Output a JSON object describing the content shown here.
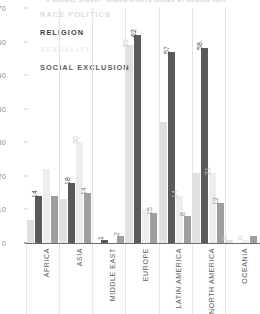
{
  "title": "A GLOBAL SURVEY: HUMAN RIGHTS ISSUES BY REGION 2014",
  "legend": {
    "position": "top-left",
    "items": [
      {
        "label": "RACE POLITICS",
        "color": "#e0e0e0"
      },
      {
        "label": "RELIGION",
        "color": "#5a5a5a"
      },
      {
        "label": "SEXUALITY",
        "color": "#ededed"
      },
      {
        "label": "SOCIAL EXCLUSION",
        "color": "#9f9f9f"
      }
    ]
  },
  "chart_data": {
    "type": "bar",
    "title": "A GLOBAL SURVEY: HUMAN RIGHTS ISSUES BY REGION 2014",
    "xlabel": "",
    "ylabel": "",
    "ylim": [
      0,
      70
    ],
    "yticks": [
      0,
      10,
      20,
      30,
      40,
      50,
      60,
      70
    ],
    "grid": false,
    "legend_position": "top-left",
    "categories": [
      "AFRICA",
      "ASIA",
      "MIDDLE EAST",
      "EUROPE",
      "LATIN AMERICA",
      "NORTH AMERICA",
      "OCEANIA"
    ],
    "series": [
      {
        "name": "RACE POLITICS",
        "color": "#e0e0e0",
        "values": [
          7,
          13,
          0,
          59,
          36,
          21,
          1
        ]
      },
      {
        "name": "RELIGION",
        "color": "#5a5a5a",
        "values": [
          14,
          18,
          1,
          62,
          57,
          58,
          0
        ]
      },
      {
        "name": "SEXUALITY",
        "color": "#ededed",
        "values": [
          22,
          30,
          0,
          10,
          14,
          21,
          1
        ]
      },
      {
        "name": "SOCIAL EXCLUSION",
        "color": "#9f9f9f",
        "values": [
          14,
          15,
          2,
          9,
          8,
          12,
          2
        ]
      }
    ],
    "point_labels": [
      {
        "category": "AFRICA",
        "series": "RELIGION",
        "value": 14
      },
      {
        "category": "ASIA",
        "series": "RELIGION",
        "value": 18
      },
      {
        "category": "ASIA",
        "series": "SOCIAL EXCLUSION",
        "value": 14
      },
      {
        "category": "ASIA",
        "series": "SEXUALITY",
        "value": 30
      },
      {
        "category": "MIDDLE EAST",
        "series": "RELIGION",
        "value": 1
      },
      {
        "category": "MIDDLE EAST",
        "series": "SOCIAL EXCLUSION",
        "value": 2
      },
      {
        "category": "EUROPE",
        "series": "RELIGION",
        "value": 62
      },
      {
        "category": "EUROPE",
        "series": "RACE POLITICS",
        "value": 59
      },
      {
        "category": "EUROPE",
        "series": "SOCIAL EXCLUSION",
        "value": 15
      },
      {
        "category": "LATIN AMERICA",
        "series": "RELIGION",
        "value": 57
      },
      {
        "category": "LATIN AMERICA",
        "series": "SEXUALITY",
        "value": 14
      },
      {
        "category": "LATIN AMERICA",
        "series": "SOCIAL EXCLUSION",
        "value": 8
      },
      {
        "category": "NORTH AMERICA",
        "series": "RELIGION",
        "value": 58
      },
      {
        "category": "NORTH AMERICA",
        "series": "SEXUALITY",
        "value": 21
      },
      {
        "category": "NORTH AMERICA",
        "series": "SOCIAL EXCLUSION",
        "value": 12
      },
      {
        "category": "OCEANIA",
        "series": "RACE POLITICS",
        "value": 0
      },
      {
        "category": "OCEANIA",
        "series": "SEXUALITY",
        "value": 0
      }
    ]
  }
}
